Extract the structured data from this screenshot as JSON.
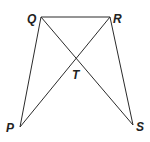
{
  "diagram": {
    "points": {
      "Q": {
        "label": "Q",
        "x": 41,
        "y": 17,
        "lx": 27,
        "ly": 23
      },
      "R": {
        "label": "R",
        "x": 110,
        "y": 17,
        "lx": 113,
        "ly": 23
      },
      "T": {
        "label": "T",
        "x": 76,
        "y": 58,
        "lx": 72,
        "ly": 79
      },
      "P": {
        "label": "P",
        "x": 20,
        "y": 127,
        "lx": 6,
        "ly": 132
      },
      "S": {
        "label": "S",
        "x": 133,
        "y": 125,
        "lx": 136,
        "ly": 131
      }
    },
    "segments": [
      {
        "name": "QR",
        "from": "Q",
        "to": "R"
      },
      {
        "name": "QP",
        "from": "Q",
        "to": "P"
      },
      {
        "name": "QS",
        "from": "Q",
        "to": "S"
      },
      {
        "name": "RP",
        "from": "R",
        "to": "P"
      },
      {
        "name": "RS",
        "from": "R",
        "to": "S"
      }
    ],
    "colors": {
      "line": "#2b2b2b",
      "label": "#222222",
      "background": "#ffffff"
    }
  }
}
